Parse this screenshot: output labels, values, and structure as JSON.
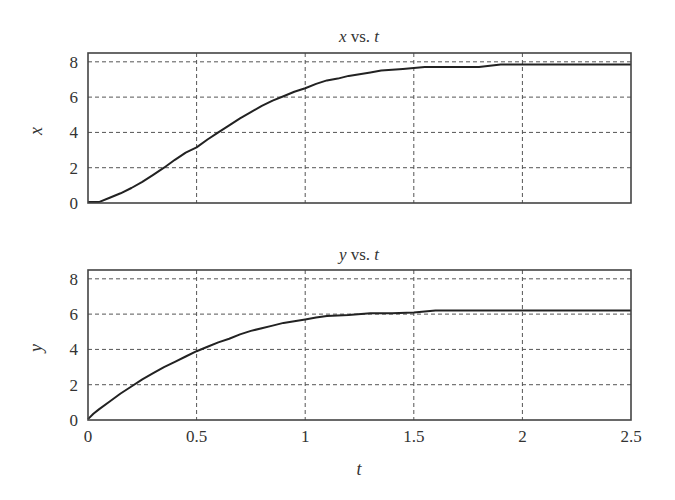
{
  "chart_data": [
    {
      "type": "line",
      "title": "x vs. t",
      "title_var": "x",
      "title_mid": " vs. ",
      "title_var2": "t",
      "xlabel": "",
      "ylabel": "x",
      "xlim": [
        0,
        2.5
      ],
      "ylim": [
        0,
        8.5
      ],
      "xticks": [
        0,
        0.5,
        1,
        1.5,
        2,
        2.5
      ],
      "xtick_labels_visible": false,
      "yticks": [
        0,
        2,
        4,
        6,
        8
      ],
      "ytick_labels": [
        "0",
        "2",
        "4",
        "6",
        "8"
      ],
      "grid": true,
      "series": [
        {
          "name": "x",
          "x": [
            0,
            0.05,
            0.1,
            0.15,
            0.2,
            0.25,
            0.3,
            0.35,
            0.4,
            0.45,
            0.5,
            0.55,
            0.6,
            0.65,
            0.7,
            0.75,
            0.8,
            0.85,
            0.9,
            0.95,
            1.0,
            1.05,
            1.1,
            1.15,
            1.2,
            1.25,
            1.3,
            1.35,
            1.4,
            1.45,
            1.5,
            1.55,
            1.6,
            1.7,
            1.8,
            1.9,
            2.0,
            2.1,
            2.2,
            2.3,
            2.4,
            2.5
          ],
          "values": [
            0.05,
            0.05,
            0.3,
            0.55,
            0.85,
            1.2,
            1.6,
            2.0,
            2.45,
            2.85,
            3.15,
            3.6,
            4.0,
            4.4,
            4.8,
            5.15,
            5.5,
            5.8,
            6.05,
            6.3,
            6.5,
            6.75,
            6.95,
            7.05,
            7.2,
            7.3,
            7.4,
            7.5,
            7.55,
            7.6,
            7.65,
            7.7,
            7.7,
            7.7,
            7.7,
            7.85,
            7.85,
            7.85,
            7.85,
            7.85,
            7.85,
            7.85
          ]
        }
      ]
    },
    {
      "type": "line",
      "title": "y vs. t",
      "title_var": "y",
      "title_mid": " vs. ",
      "title_var2": "t",
      "xlabel": "t",
      "ylabel": "y",
      "xlim": [
        0,
        2.5
      ],
      "ylim": [
        0,
        8.5
      ],
      "xticks": [
        0,
        0.5,
        1,
        1.5,
        2,
        2.5
      ],
      "xtick_labels": [
        "0",
        "0.5",
        "1",
        "1.5",
        "2",
        "2.5"
      ],
      "yticks": [
        0,
        2,
        4,
        6,
        8
      ],
      "ytick_labels": [
        "0",
        "2",
        "4",
        "6",
        "8"
      ],
      "grid": true,
      "series": [
        {
          "name": "y",
          "x": [
            0,
            0.025,
            0.05,
            0.1,
            0.15,
            0.2,
            0.25,
            0.3,
            0.35,
            0.4,
            0.45,
            0.5,
            0.55,
            0.6,
            0.65,
            0.7,
            0.75,
            0.8,
            0.85,
            0.9,
            0.95,
            1.0,
            1.05,
            1.1,
            1.2,
            1.3,
            1.4,
            1.5,
            1.6,
            1.8,
            2.0,
            2.2,
            2.5
          ],
          "values": [
            0.05,
            0.35,
            0.6,
            1.05,
            1.5,
            1.9,
            2.3,
            2.65,
            3.0,
            3.3,
            3.6,
            3.9,
            4.15,
            4.4,
            4.6,
            4.85,
            5.05,
            5.2,
            5.35,
            5.5,
            5.6,
            5.7,
            5.8,
            5.9,
            5.95,
            6.05,
            6.05,
            6.1,
            6.2,
            6.2,
            6.2,
            6.2,
            6.2
          ]
        }
      ]
    }
  ],
  "labels": {
    "top_title_var": "x",
    "top_title_mid": " vs. ",
    "top_title_var2": "t",
    "top_ylabel": "x",
    "bottom_title_var": "y",
    "bottom_title_mid": " vs. ",
    "bottom_title_var2": "t",
    "bottom_ylabel": "y",
    "bottom_xlabel": "t"
  }
}
